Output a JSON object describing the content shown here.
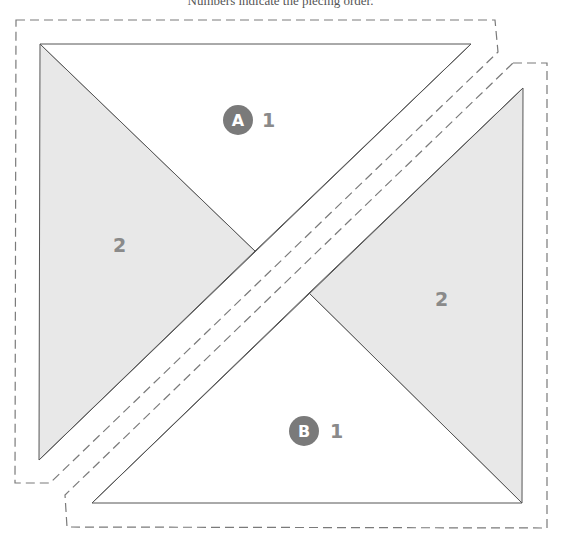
{
  "caption": "Numbers indicate the piecing order.",
  "colors": {
    "shaded": "#e8e8e8",
    "outline": "#555555",
    "dashed": "#7a7a7a",
    "badge": "#7a7a7a",
    "number": "#8a8a8a"
  },
  "units": [
    {
      "id": "A",
      "badge": "A",
      "pieces": [
        {
          "label": "1",
          "shaded": false
        },
        {
          "label": "2",
          "shaded": true
        }
      ]
    },
    {
      "id": "B",
      "badge": "B",
      "pieces": [
        {
          "label": "1",
          "shaded": false
        },
        {
          "label": "2",
          "shaded": true
        }
      ]
    }
  ]
}
